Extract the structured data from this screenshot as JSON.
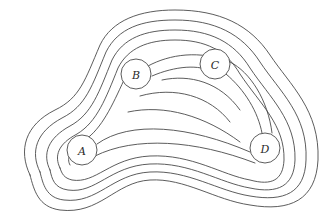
{
  "diagram": {
    "type": "contour-map",
    "stroke_color": "#4a4a4a",
    "background": "#ffffff",
    "markers": [
      {
        "id": "A",
        "label": "A",
        "cx": 82,
        "cy": 150,
        "r": 15
      },
      {
        "id": "B",
        "label": "B",
        "cx": 136,
        "cy": 74,
        "r": 15
      },
      {
        "id": "C",
        "label": "C",
        "cx": 215,
        "cy": 64,
        "r": 15
      },
      {
        "id": "D",
        "label": "D",
        "cx": 265,
        "cy": 148,
        "r": 15
      }
    ],
    "contour_count": 11
  }
}
